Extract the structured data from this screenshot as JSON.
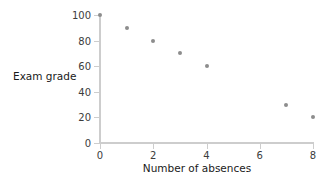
{
  "chart_data": {
    "type": "scatter",
    "title": "",
    "xlabel": "Number of absences",
    "ylabel": "Exam grade",
    "xlim": [
      0,
      8
    ],
    "ylim": [
      0,
      100
    ],
    "xticks": [
      0,
      2,
      4,
      6,
      8
    ],
    "yticks": [
      0,
      20,
      40,
      60,
      80,
      100
    ],
    "xtick_labels": [
      "0",
      "2",
      "4",
      "6",
      "8"
    ],
    "ytick_labels": [
      "0",
      "20",
      "40",
      "60",
      "80",
      "100"
    ],
    "grid": false,
    "legend": null,
    "marker_color": "#8d8d8d",
    "axis_color": "#cdcdcd",
    "text_color": "#1a1a1a",
    "background": "#ffffff",
    "x": [
      0,
      1,
      2,
      3,
      4,
      7,
      8
    ],
    "y": [
      100,
      90,
      80,
      70,
      60,
      30,
      20
    ],
    "points": [
      {
        "x": 0,
        "y": 100
      },
      {
        "x": 1,
        "y": 90
      },
      {
        "x": 2,
        "y": 80
      },
      {
        "x": 3,
        "y": 70
      },
      {
        "x": 4,
        "y": 60
      },
      {
        "x": 7,
        "y": 30
      },
      {
        "x": 8,
        "y": 20
      }
    ]
  }
}
